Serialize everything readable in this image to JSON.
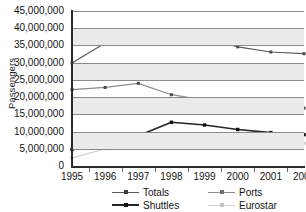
{
  "chart_data": {
    "type": "line",
    "title": "",
    "xlabel": "",
    "ylabel": "Passengers",
    "categories": [
      "1995",
      "1996",
      "1997",
      "1998",
      "1999",
      "2000",
      "2001",
      "2002"
    ],
    "x": [
      1995,
      1996,
      1997,
      1998,
      1999,
      2000,
      2001,
      2002
    ],
    "ylim": [
      0,
      45000000
    ],
    "ytick_values": [
      0,
      5000000,
      10000000,
      15000000,
      20000000,
      25000000,
      30000000,
      35000000,
      40000000,
      45000000
    ],
    "ytick_labels": [
      "45,000,000",
      "40,000,000",
      "35,000,000",
      "30,000,000",
      "25,000,000",
      "20,000,000",
      "15,000,000",
      "10,000,000",
      "5,000,000",
      "0"
    ],
    "grid": true,
    "grid_axis": "y",
    "legend_position": "bottom",
    "series": [
      {
        "name": "Totals",
        "color": "#5a5a5a",
        "values": [
          29900000,
          35700000,
          38600000,
          39600000,
          37300000,
          34600000,
          33100000,
          32600000
        ]
      },
      {
        "name": "Ports",
        "color": "#8c8c8c",
        "values": [
          22200000,
          22800000,
          24000000,
          20700000,
          19100000,
          17000000,
          16400000,
          16800000
        ]
      },
      {
        "name": "Shuttles",
        "color": "#262626",
        "values": [
          4800000,
          7900000,
          8800000,
          12700000,
          11900000,
          10600000,
          9700000,
          9100000
        ]
      },
      {
        "name": "Eurostar",
        "color": "#cfcfcf",
        "values": [
          2300000,
          5000000,
          5800000,
          6000000,
          6500000,
          7200000,
          7000000,
          6600000
        ]
      }
    ]
  },
  "axes": {
    "y_title": "Passengers"
  },
  "legend": {
    "items": [
      {
        "label": "Totals",
        "color": "#5a5a5a"
      },
      {
        "label": "Shuttles",
        "color": "#262626"
      },
      {
        "label": "Ports",
        "color": "#8c8c8c"
      },
      {
        "label": "Eurostar",
        "color": "#cfcfcf"
      }
    ]
  },
  "colors": {
    "totals": "#5a5a5a",
    "ports": "#8c8c8c",
    "shuttles": "#262626",
    "eurostar": "#cfcfcf",
    "gridline": "#8a8a8a",
    "band": "#ebebeb",
    "axis": "#2b2b2b",
    "text": "#141414",
    "background": "#ffffff"
  }
}
